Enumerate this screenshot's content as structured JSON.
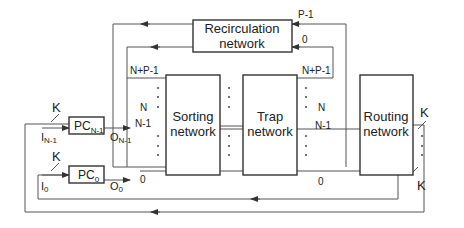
{
  "diagram": {
    "blocks": {
      "recirculation": {
        "line1": "Recirculation",
        "line2": "network"
      },
      "sorting": {
        "line1": "Sorting",
        "line2": "network"
      },
      "trap": {
        "line1": "Trap",
        "line2": "network"
      },
      "routing": {
        "line1": "Routing",
        "line2": "network"
      },
      "pc_top": {
        "base": "PC",
        "sub": "N-1"
      },
      "pc_bottom": {
        "base": "PC",
        "sub": "0"
      }
    },
    "labels": {
      "recirc_out_top": "P-1",
      "recirc_out_bottom": "0",
      "sort_in_np1": "N+P-1",
      "sort_in_n": "N",
      "sort_in_n1": "N-1",
      "sort_in_0": "0",
      "trap_out_np1": "N+P-1",
      "trap_out_n": "N",
      "trap_out_n1": "N-1",
      "trap_out_0": "0",
      "k_top_left": "K",
      "k_bottom_left": "K",
      "k_top_right": "K",
      "k_bottom_right": "K",
      "in_top_base": "I",
      "in_top_sub": "N-1",
      "out_top_base": "O",
      "out_top_sub": "N-1",
      "in_bottom_base": "I",
      "in_bottom_sub": "0",
      "out_bottom_base": "O",
      "out_bottom_sub": "0"
    }
  }
}
